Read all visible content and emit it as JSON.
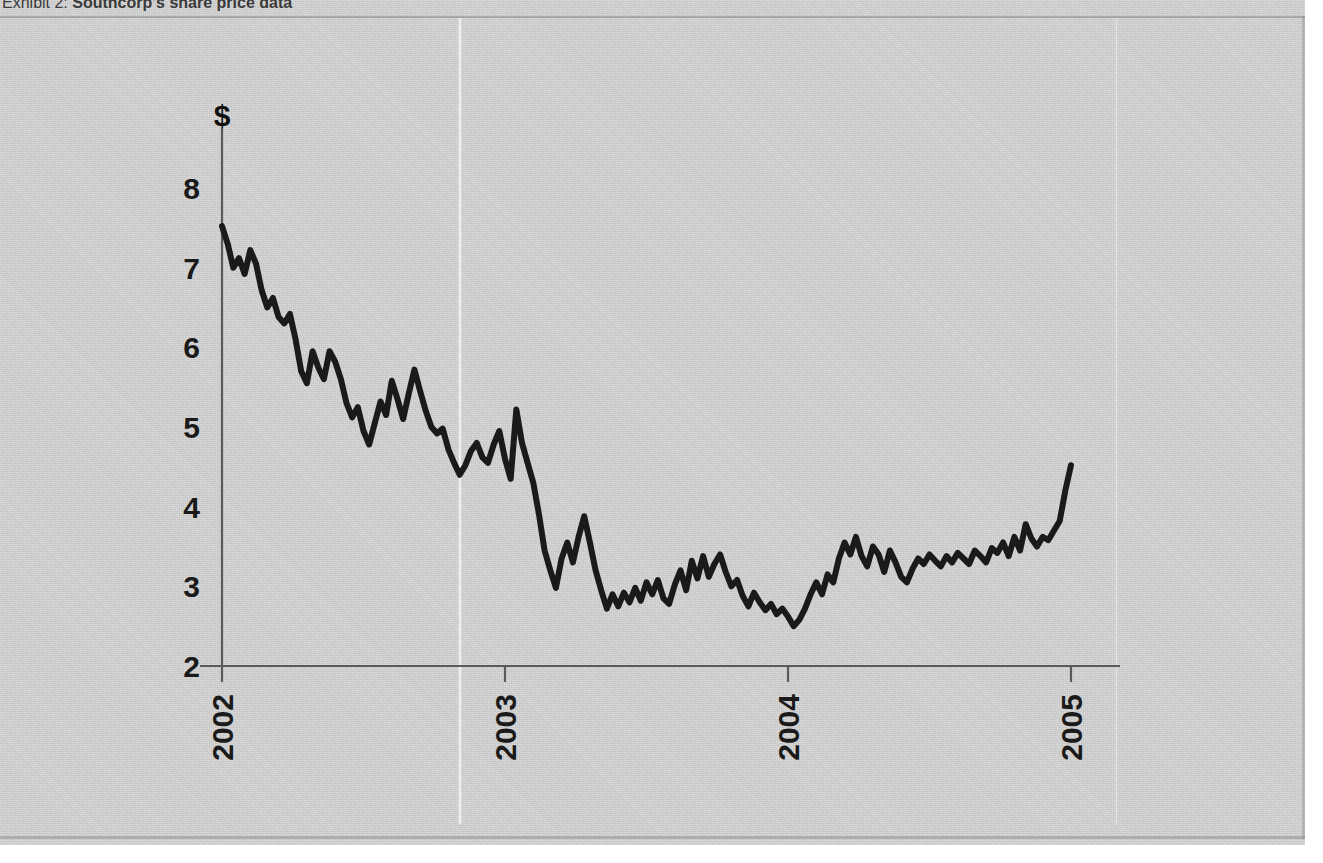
{
  "exhibit": {
    "label": "Exhibit 2:",
    "title": "Southcorp's share price data",
    "full_title": "Exhibit 2: Southcorp's share price data"
  },
  "chart_data": {
    "type": "line",
    "title": "Southcorp's share price data",
    "xlabel": "",
    "ylabel": "$",
    "y_axis_unit": "$",
    "ylim": [
      2,
      8
    ],
    "yticks": [
      "2",
      "3",
      "4",
      "5",
      "6",
      "7",
      "8"
    ],
    "xticks": [
      "2002",
      "2003",
      "2004",
      "2005"
    ],
    "xtick_rotation": -90,
    "xlim": [
      "2002",
      "2005"
    ],
    "grid": false,
    "legend": false,
    "line_color": "#1a1a1a",
    "line_width": 6,
    "series": [
      {
        "name": "Southcorp share price",
        "x": [
          2002.0,
          2002.02,
          2002.04,
          2002.06,
          2002.08,
          2002.1,
          2002.12,
          2002.14,
          2002.16,
          2002.18,
          2002.2,
          2002.22,
          2002.24,
          2002.26,
          2002.28,
          2002.3,
          2002.32,
          2002.34,
          2002.36,
          2002.38,
          2002.4,
          2002.42,
          2002.44,
          2002.46,
          2002.48,
          2002.5,
          2002.52,
          2002.54,
          2002.56,
          2002.58,
          2002.6,
          2002.62,
          2002.64,
          2002.66,
          2002.68,
          2002.7,
          2002.72,
          2002.74,
          2002.76,
          2002.78,
          2002.8,
          2002.82,
          2002.84,
          2002.86,
          2002.88,
          2002.9,
          2002.92,
          2002.94,
          2002.96,
          2002.98,
          2003.0,
          2003.02,
          2003.04,
          2003.06,
          2003.08,
          2003.1,
          2003.12,
          2003.14,
          2003.16,
          2003.18,
          2003.2,
          2003.22,
          2003.24,
          2003.26,
          2003.28,
          2003.3,
          2003.32,
          2003.34,
          2003.36,
          2003.38,
          2003.4,
          2003.42,
          2003.44,
          2003.46,
          2003.48,
          2003.5,
          2003.52,
          2003.54,
          2003.56,
          2003.58,
          2003.6,
          2003.62,
          2003.64,
          2003.66,
          2003.68,
          2003.7,
          2003.72,
          2003.74,
          2003.76,
          2003.78,
          2003.8,
          2003.82,
          2003.84,
          2003.86,
          2003.88,
          2003.9,
          2003.92,
          2003.94,
          2003.96,
          2003.98,
          2004.0,
          2004.02,
          2004.04,
          2004.06,
          2004.08,
          2004.1,
          2004.12,
          2004.14,
          2004.16,
          2004.18,
          2004.2,
          2004.22,
          2004.24,
          2004.26,
          2004.28,
          2004.3,
          2004.32,
          2004.34,
          2004.36,
          2004.38,
          2004.4,
          2004.42,
          2004.44,
          2004.46,
          2004.48,
          2004.5,
          2004.52,
          2004.54,
          2004.56,
          2004.58,
          2004.6,
          2004.62,
          2004.64,
          2004.66,
          2004.68,
          2004.7,
          2004.72,
          2004.74,
          2004.76,
          2004.78,
          2004.8,
          2004.82,
          2004.84,
          2004.86,
          2004.88,
          2004.9,
          2004.92,
          2004.94,
          2004.96,
          2004.98,
          2005.0
        ],
        "y": [
          7.52,
          7.3,
          7.0,
          7.12,
          6.92,
          7.22,
          7.05,
          6.72,
          6.5,
          6.62,
          6.38,
          6.3,
          6.42,
          6.1,
          5.7,
          5.55,
          5.95,
          5.75,
          5.6,
          5.95,
          5.82,
          5.6,
          5.3,
          5.12,
          5.25,
          4.95,
          4.78,
          5.05,
          5.32,
          5.15,
          5.58,
          5.35,
          5.1,
          5.42,
          5.72,
          5.45,
          5.2,
          5.0,
          4.92,
          4.98,
          4.72,
          4.55,
          4.4,
          4.52,
          4.7,
          4.8,
          4.62,
          4.55,
          4.78,
          4.95,
          4.6,
          4.35,
          5.22,
          4.8,
          4.55,
          4.3,
          3.9,
          3.45,
          3.2,
          2.98,
          3.35,
          3.55,
          3.3,
          3.62,
          3.88,
          3.55,
          3.2,
          2.95,
          2.72,
          2.9,
          2.75,
          2.92,
          2.8,
          2.98,
          2.82,
          3.05,
          2.9,
          3.08,
          2.85,
          2.78,
          3.02,
          3.2,
          2.95,
          3.32,
          3.1,
          3.38,
          3.12,
          3.28,
          3.4,
          3.18,
          3.0,
          3.08,
          2.88,
          2.75,
          2.92,
          2.8,
          2.7,
          2.78,
          2.65,
          2.72,
          2.62,
          2.5,
          2.58,
          2.72,
          2.9,
          3.05,
          2.9,
          3.15,
          3.05,
          3.35,
          3.55,
          3.4,
          3.62,
          3.38,
          3.25,
          3.5,
          3.4,
          3.18,
          3.45,
          3.3,
          3.12,
          3.05,
          3.22,
          3.35,
          3.28,
          3.4,
          3.32,
          3.25,
          3.38,
          3.3,
          3.42,
          3.35,
          3.28,
          3.45,
          3.38,
          3.3,
          3.48,
          3.42,
          3.55,
          3.38,
          3.62,
          3.45,
          3.78,
          3.6,
          3.5,
          3.62,
          3.58,
          3.7,
          3.82,
          4.2,
          4.52
        ]
      }
    ]
  },
  "figure": {
    "y_axis_title": "$",
    "background_color": "#d4d4d4",
    "line_color": "#1a1a1a",
    "axis_color": "#4a4a4a"
  }
}
